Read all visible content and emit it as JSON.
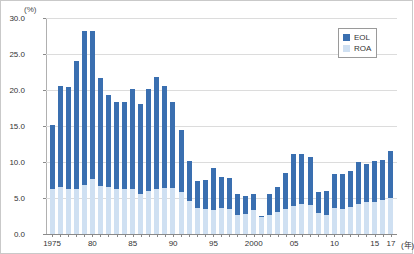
{
  "chart_data": {
    "type": "bar",
    "stacked": true,
    "title": "",
    "subtitle": "",
    "xlabel": "(年)",
    "ylabel": "(%)",
    "ylim": [
      0.0,
      30.0
    ],
    "yticks": [
      "0.0",
      "5.0",
      "10.0",
      "15.0",
      "20.0",
      "25.0",
      "30.0"
    ],
    "ytick_values": [
      0.0,
      5.0,
      10.0,
      15.0,
      20.0,
      25.0,
      30.0
    ],
    "grid": true,
    "legend_position": "top-right",
    "categories": [
      "1975",
      "1976",
      "1977",
      "1978",
      "1979",
      "1980",
      "1981",
      "1982",
      "1983",
      "1984",
      "1985",
      "1986",
      "1987",
      "1988",
      "1989",
      "1990",
      "1991",
      "1992",
      "1993",
      "1994",
      "1995",
      "1996",
      "1997",
      "1998",
      "1999",
      "2000",
      "2001",
      "2002",
      "2003",
      "2004",
      "2005",
      "2006",
      "2007",
      "2008",
      "2009",
      "2010",
      "2011",
      "2012",
      "2013",
      "2014",
      "2015",
      "2016",
      "2017"
    ],
    "xtick_labels": [
      "1975",
      "80",
      "85",
      "90",
      "95",
      "2000",
      "05",
      "10",
      "15",
      "17"
    ],
    "xtick_indices": [
      0,
      5,
      10,
      15,
      20,
      25,
      30,
      35,
      40,
      42
    ],
    "series": [
      {
        "name": "ROA",
        "color": "#cfe0f2",
        "values": [
          6.2,
          6.5,
          6.3,
          6.3,
          6.8,
          7.6,
          6.7,
          6.5,
          6.2,
          6.2,
          6.3,
          5.6,
          6.0,
          6.2,
          6.4,
          6.4,
          5.8,
          4.6,
          3.6,
          3.5,
          3.3,
          3.6,
          3.5,
          2.6,
          2.8,
          3.3,
          2.4,
          2.6,
          3.0,
          3.5,
          3.9,
          4.1,
          4.0,
          2.9,
          2.7,
          3.6,
          3.5,
          3.7,
          4.2,
          4.4,
          4.5,
          4.7,
          5.0
        ]
      },
      {
        "name": "EOL",
        "color": "#3a6fb0",
        "values": [
          9.0,
          14.0,
          14.1,
          17.7,
          21.4,
          20.6,
          15.0,
          12.8,
          12.2,
          12.1,
          13.8,
          12.4,
          14.1,
          15.6,
          14.2,
          11.9,
          8.6,
          5.6,
          3.8,
          4.0,
          5.9,
          4.3,
          4.3,
          3.0,
          2.5,
          2.2,
          0.1,
          2.9,
          3.6,
          5.0,
          7.2,
          7.0,
          6.7,
          3.0,
          3.3,
          4.8,
          4.9,
          5.0,
          5.8,
          5.3,
          5.6,
          5.6,
          6.5
        ]
      }
    ],
    "totals": [
      15.2,
      20.5,
      20.4,
      24.0,
      28.2,
      28.2,
      21.7,
      19.3,
      18.4,
      18.3,
      20.1,
      18.0,
      20.1,
      21.8,
      20.6,
      18.3,
      14.4,
      10.2,
      7.4,
      7.5,
      9.2,
      7.9,
      7.8,
      5.6,
      5.3,
      5.5,
      2.5,
      5.5,
      6.6,
      8.5,
      11.1,
      11.1,
      10.7,
      5.9,
      6.0,
      8.4,
      8.4,
      8.7,
      10.0,
      9.7,
      10.1,
      10.3,
      11.5
    ]
  },
  "legend": {
    "items": [
      {
        "label": "EOL",
        "color": "#3a6fb0"
      },
      {
        "label": "ROA",
        "color": "#cfe0f2"
      }
    ]
  },
  "axes": {
    "y_unit": "(%)",
    "x_unit": "(年)"
  }
}
